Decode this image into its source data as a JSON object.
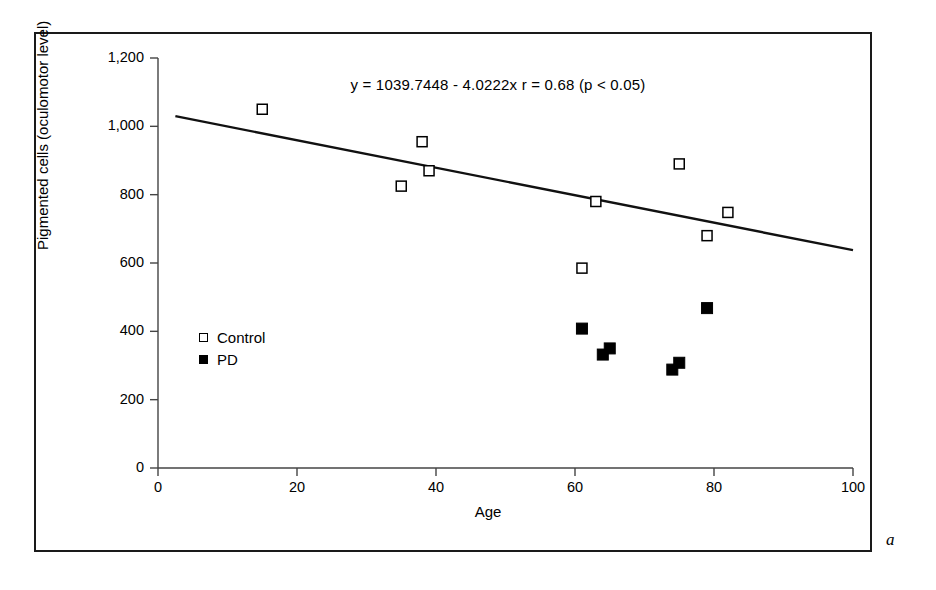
{
  "figure": {
    "panel_letter": "a",
    "annotation": "y = 1039.7448 - 4.0222x  r = 0.68 (p < 0.05)"
  },
  "legend": {
    "position": "inside-left",
    "entries": [
      {
        "label": "Control",
        "marker": "open-square"
      },
      {
        "label": "PD",
        "marker": "filled-square"
      }
    ]
  },
  "chart_data": {
    "type": "scatter",
    "title": "",
    "subtitle": "",
    "xlabel": "Age",
    "ylabel": "Pigmented cells (oculomotor level)",
    "xlim": [
      0,
      100
    ],
    "ylim": [
      0,
      1200
    ],
    "xticks": [
      0,
      20,
      40,
      60,
      80,
      100
    ],
    "xtick_labels": [
      "0",
      "20",
      "40",
      "60",
      "80",
      "100"
    ],
    "yticks": [
      0,
      200,
      400,
      600,
      800,
      1000,
      1200
    ],
    "ytick_labels": [
      "0",
      "200",
      "400",
      "600",
      "800",
      "1,000",
      "1,200"
    ],
    "grid": false,
    "annotations": [
      {
        "text": "y = 1039.7448 - 4.0222x  r = 0.68 (p < 0.05)",
        "x": 47,
        "y": 1140
      }
    ],
    "series": [
      {
        "name": "Control",
        "marker": "open-square",
        "color": "#000000",
        "points": [
          {
            "x": 15,
            "y": 1050
          },
          {
            "x": 35,
            "y": 825
          },
          {
            "x": 38,
            "y": 955
          },
          {
            "x": 39,
            "y": 870
          },
          {
            "x": 61,
            "y": 585
          },
          {
            "x": 63,
            "y": 780
          },
          {
            "x": 75,
            "y": 890
          },
          {
            "x": 79,
            "y": 680
          },
          {
            "x": 82,
            "y": 748
          }
        ]
      },
      {
        "name": "PD",
        "marker": "filled-square",
        "color": "#000000",
        "points": [
          {
            "x": 61,
            "y": 408
          },
          {
            "x": 64,
            "y": 332
          },
          {
            "x": 65,
            "y": 350
          },
          {
            "x": 74,
            "y": 288
          },
          {
            "x": 75,
            "y": 308
          },
          {
            "x": 79,
            "y": 468
          }
        ]
      }
    ],
    "fit_line": {
      "name": "regression-line",
      "equation": "y = 1039.7448 - 4.0222x",
      "intercept": 1039.7448,
      "slope": -4.0222,
      "r": 0.68,
      "p_text": "p < 0.05",
      "x_start": 2.5,
      "x_end": 100
    }
  }
}
